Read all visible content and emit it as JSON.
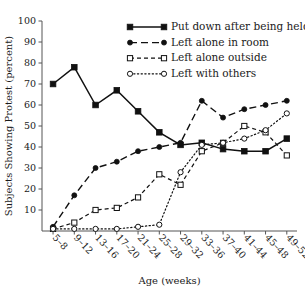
{
  "chart_data": {
    "type": "line",
    "title": "",
    "xlabel": "Age (weeks)",
    "ylabel": "Subjects Showing Protest (percent)",
    "categories": [
      "5–8",
      "9–12",
      "13–16",
      "17–20",
      "21–24",
      "25–28",
      "29–32",
      "33–36",
      "37–40",
      "41–44",
      "45–48",
      "49–52"
    ],
    "ylim": [
      0,
      100
    ],
    "yticks": [
      10,
      20,
      30,
      40,
      50,
      60,
      70,
      80,
      90,
      100
    ],
    "grid": false,
    "legend_position": "top-right",
    "series": [
      {
        "name": "Put down after being held",
        "marker": "filled-square",
        "linestyle": "solid",
        "values": [
          70,
          78,
          60,
          67,
          57,
          47,
          41,
          42,
          39,
          38,
          38,
          44
        ]
      },
      {
        "name": "Left alone in room",
        "marker": "filled-circle",
        "linestyle": "dashed-long",
        "values": [
          2,
          17,
          30,
          33,
          38,
          40,
          42,
          62,
          54,
          58,
          60,
          62
        ]
      },
      {
        "name": "Left alone outside",
        "marker": "open-square",
        "linestyle": "dashed-short",
        "values": [
          1,
          4,
          10,
          11,
          16,
          27,
          22,
          38,
          42,
          50,
          47,
          36
        ]
      },
      {
        "name": "Left with others",
        "marker": "open-circle",
        "linestyle": "dotted",
        "values": [
          1,
          1,
          1,
          1,
          2,
          3,
          28,
          41,
          42,
          44,
          48,
          56
        ]
      }
    ]
  },
  "legend": {
    "entries": [
      {
        "label": "Put down after being held"
      },
      {
        "label": "Left alone in room"
      },
      {
        "label": "Left alone outside"
      },
      {
        "label": "Left with others"
      }
    ]
  },
  "axes": {
    "y_title": "Subjects Showing Protest (percent)",
    "x_title": "Age (weeks)"
  }
}
